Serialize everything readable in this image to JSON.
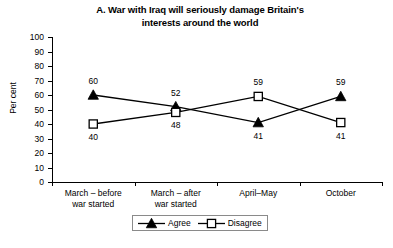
{
  "chart_data": {
    "type": "line",
    "title": "A. War with Iraq will seriously damage Britain's interests around the world",
    "title_line1": "A. War with Iraq will seriously damage Britain's",
    "title_line2": "interests around the world",
    "xlabel": "",
    "ylabel": "Per cent",
    "ylim": [
      0,
      100
    ],
    "ytick_step": 10,
    "yticks": [
      "100",
      "90",
      "80",
      "70",
      "60",
      "50",
      "40",
      "30",
      "20",
      "10",
      "0"
    ],
    "grid": false,
    "legend_position": "bottom-center",
    "categories": [
      "March – before war started",
      "March – after war started",
      "April–May",
      "October"
    ],
    "category_lines": [
      [
        "March – before",
        "war started"
      ],
      [
        "March – after",
        "war started"
      ],
      [
        "April–May",
        ""
      ],
      [
        "October",
        ""
      ]
    ],
    "series": [
      {
        "name": "Agree",
        "marker": "filled-triangle",
        "values": [
          60,
          52,
          41,
          59
        ],
        "label_positions": [
          "above",
          "above",
          "below",
          "above"
        ]
      },
      {
        "name": "Disagree",
        "marker": "open-square",
        "values": [
          40,
          48,
          59,
          41
        ],
        "label_positions": [
          "below",
          "below",
          "above",
          "below"
        ]
      }
    ]
  },
  "legend": {
    "entries": [
      {
        "label": "Agree",
        "marker": "filled-triangle"
      },
      {
        "label": "Disagree",
        "marker": "open-square"
      }
    ]
  },
  "colors": {
    "series": "#000000",
    "axis": "#000000",
    "background": "#ffffff",
    "legend_border": "#8a8a8a"
  }
}
